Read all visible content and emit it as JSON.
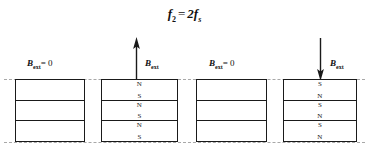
{
  "figure": {
    "title_formula": {
      "lhs_var": "f",
      "lhs_sub": "2",
      "equals": "=",
      "rhs_coef": "2",
      "rhs_var": "f",
      "rhs_sub": "s",
      "plain_text": "f2 = 2fs"
    },
    "guides": {
      "top_label": "top-alignment-guide",
      "bottom_label": "bottom-alignment-guide",
      "color": "#a8a8a8",
      "style": "dashed"
    },
    "colors": {
      "block_border": "#1a1a1a",
      "block_fill": "#ffffff",
      "guide": "#a8a8a8",
      "text": "#111111",
      "background": "#ffffff"
    },
    "field_symbol": "B",
    "field_subscript": "ext",
    "zero_value": "= 0",
    "panels": [
      {
        "id": "panel-1",
        "label_kind": "zero-field",
        "label_text": "B_ext = 0",
        "arrow": "none",
        "x": 15,
        "width": 70,
        "layers": [
          {
            "top_pole": "",
            "bottom_pole": ""
          },
          {
            "top_pole": "",
            "bottom_pole": ""
          },
          {
            "top_pole": "",
            "bottom_pole": ""
          }
        ]
      },
      {
        "id": "panel-2",
        "label_kind": "field",
        "label_text": "B_ext",
        "arrow": "up",
        "x": 101,
        "width": 77,
        "layers": [
          {
            "top_pole": "N",
            "bottom_pole": "S"
          },
          {
            "top_pole": "N",
            "bottom_pole": "S"
          },
          {
            "top_pole": "N",
            "bottom_pole": "S"
          }
        ]
      },
      {
        "id": "panel-3",
        "label_kind": "zero-field",
        "label_text": "B_ext = 0",
        "arrow": "none",
        "x": 196,
        "width": 71,
        "layers": [
          {
            "top_pole": "",
            "bottom_pole": ""
          },
          {
            "top_pole": "",
            "bottom_pole": ""
          },
          {
            "top_pole": "",
            "bottom_pole": ""
          }
        ]
      },
      {
        "id": "panel-4",
        "label_kind": "field",
        "label_text": "B_ext",
        "arrow": "down",
        "x": 283,
        "width": 74,
        "layers": [
          {
            "top_pole": "S",
            "bottom_pole": "N"
          },
          {
            "top_pole": "S",
            "bottom_pole": "N"
          },
          {
            "top_pole": "S",
            "bottom_pole": "N"
          }
        ]
      }
    ]
  }
}
